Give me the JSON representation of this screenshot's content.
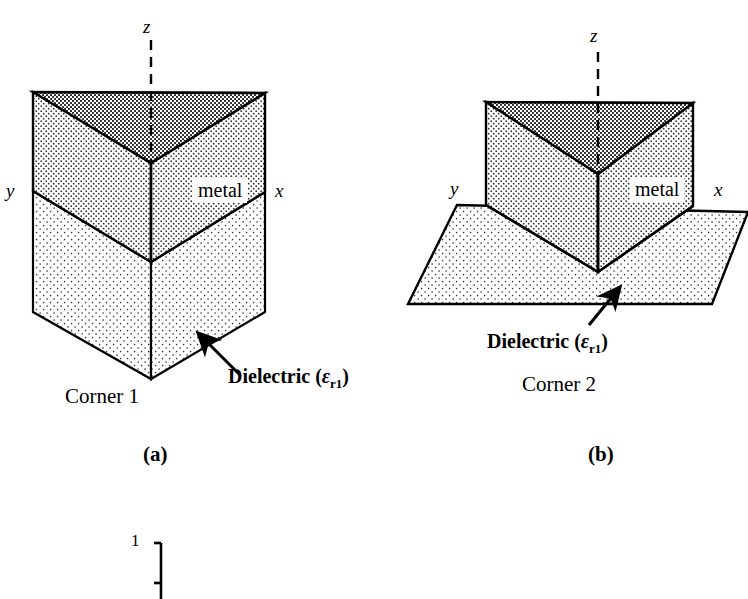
{
  "figure": {
    "background_color": "#ffffff",
    "line_color": "#000000",
    "fill_top_face": "#a8a8a8",
    "fill_side_face": "#d9d9d9",
    "fill_dielectric": "#e8e8e8"
  },
  "panel_a": {
    "caption": "(a)",
    "corner_label": "Corner 1",
    "metal_label": "metal",
    "dielectric_label_text": "Dielectric (",
    "dielectric_symbol": "ε",
    "dielectric_subscript": "r1",
    "dielectric_label_close": ")",
    "axis_z": "z",
    "axis_y": "y",
    "axis_x": "x"
  },
  "panel_b": {
    "caption": "(b)",
    "corner_label": "Corner 2",
    "metal_label": "metal",
    "dielectric_label_text": "Dielectric (",
    "dielectric_symbol": "ε",
    "dielectric_subscript": "r1",
    "dielectric_label_close": ")",
    "axis_z": "z",
    "axis_y": "y",
    "axis_x": "x"
  },
  "partial_figure": {
    "tick_value": "1"
  }
}
